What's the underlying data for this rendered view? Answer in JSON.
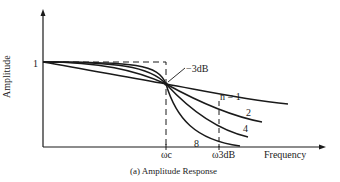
{
  "figure": {
    "caption": "(a)  Amplitude Response",
    "y_axis_label": "Amplitude",
    "x_axis_label": "Frequency",
    "y_tick_label": "1",
    "cutoff_label": "ωc",
    "stopband_label": "ω3dB",
    "annotation": "−3dB",
    "curve_labels": [
      "n = 1",
      "2",
      "4",
      "8"
    ]
  },
  "colors": {
    "line": "#1a1a1a",
    "background": "#ffffff"
  }
}
